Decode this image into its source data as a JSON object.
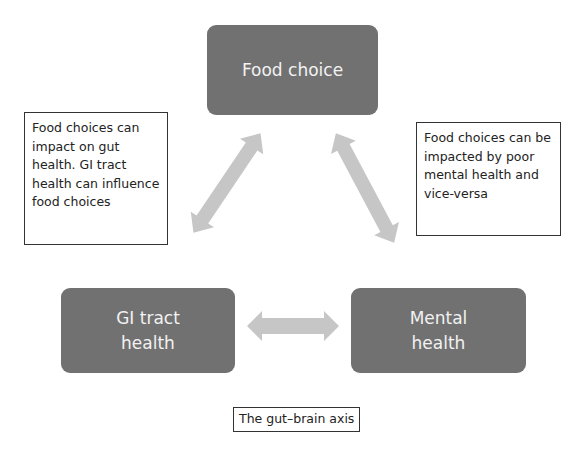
{
  "diagram": {
    "title": "The gut–brain axis",
    "nodes": [
      {
        "id": "food",
        "label": "Food choice"
      },
      {
        "id": "gi",
        "label": "GI tract health"
      },
      {
        "id": "mental",
        "label": "Mental health"
      }
    ],
    "notes": {
      "left": "Food choices can impact on gut health. GI tract health can influence food choices",
      "right": "Food choices can be impacted by poor mental health and vice-versa"
    },
    "edges": [
      {
        "from": "food",
        "to": "gi",
        "type": "bidirectional"
      },
      {
        "from": "food",
        "to": "mental",
        "type": "bidirectional"
      },
      {
        "from": "gi",
        "to": "mental",
        "type": "bidirectional"
      }
    ],
    "colors": {
      "node_fill": "#717171",
      "node_text": "#f2f2f2",
      "arrow_fill": "#c6c6c6",
      "note_border": "#333333"
    }
  }
}
